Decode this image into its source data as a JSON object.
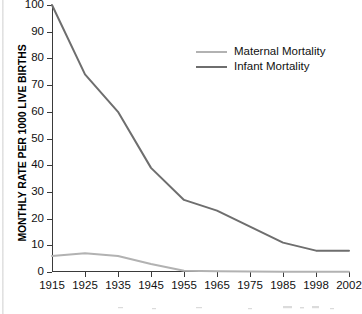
{
  "chart_data": {
    "type": "line",
    "title": "",
    "xlabel": "",
    "ylabel": "MONTHLY RATE PER 1000 LIVE BIRTHS",
    "categories": [
      "1915",
      "1925",
      "1935",
      "1945",
      "1955",
      "1965",
      "1975",
      "1985",
      "1998",
      "2002"
    ],
    "ylim": [
      0,
      100
    ],
    "y_ticks": [
      "0",
      "10",
      "20",
      "30",
      "40",
      "50",
      "60",
      "70",
      "80",
      "90",
      "100"
    ],
    "grid": false,
    "legend_position": "top-right",
    "series": [
      {
        "name": "Maternal Mortality",
        "color": "#b2b2b2",
        "values": [
          6,
          7,
          6,
          3,
          0.5,
          0.3,
          0.2,
          0.1,
          0.1,
          0.1
        ]
      },
      {
        "name": "Infant Mortality",
        "color": "#6e6e6e",
        "values": [
          100,
          74,
          60,
          39,
          27,
          23,
          17,
          11,
          8,
          8
        ]
      }
    ]
  },
  "legend": {
    "items": [
      {
        "label": "Maternal Mortality",
        "color": "#b2b2b2"
      },
      {
        "label": "Infant Mortality",
        "color": "#6e6e6e"
      }
    ]
  },
  "axis": {
    "y_title": "MONTHLY RATE PER 1000 LIVE BIRTHS"
  }
}
